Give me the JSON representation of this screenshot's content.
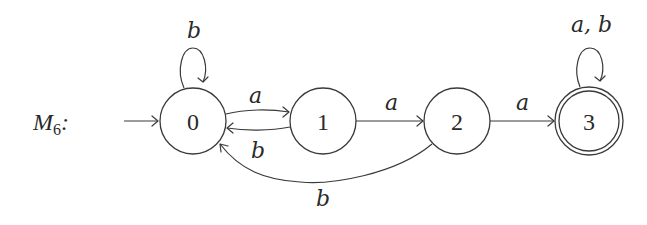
{
  "machine": {
    "name": "M",
    "subscript": "6",
    "suffix": ":"
  },
  "states": [
    {
      "id": "0",
      "label": "0",
      "start": true,
      "accept": false
    },
    {
      "id": "1",
      "label": "1",
      "start": false,
      "accept": false
    },
    {
      "id": "2",
      "label": "2",
      "start": false,
      "accept": false
    },
    {
      "id": "3",
      "label": "3",
      "start": false,
      "accept": true
    }
  ],
  "transitions": [
    {
      "from": "0",
      "to": "0",
      "label": "b"
    },
    {
      "from": "0",
      "to": "1",
      "label": "a"
    },
    {
      "from": "1",
      "to": "0",
      "label": "b"
    },
    {
      "from": "1",
      "to": "2",
      "label": "a"
    },
    {
      "from": "2",
      "to": "0",
      "label": "b"
    },
    {
      "from": "2",
      "to": "3",
      "label": "a"
    },
    {
      "from": "3",
      "to": "3",
      "label": "a, b"
    }
  ]
}
